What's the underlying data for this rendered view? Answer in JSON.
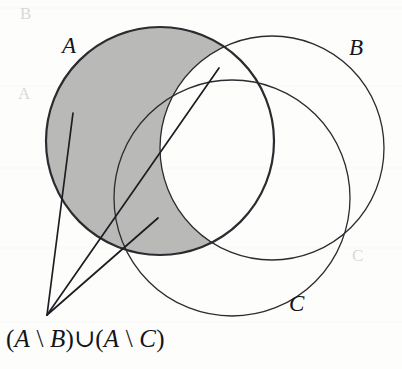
{
  "figure": {
    "kind": "venn-diagram",
    "background_color": "#fdfdfc",
    "stroke_color": "#2b2b30",
    "shade_color": "#b9b9b7",
    "width": 402,
    "height": 369
  },
  "labels": {
    "a": "A",
    "b": "B",
    "c": "C"
  },
  "caption": {
    "full_text": "(A \\ B)∪(A \\ C)",
    "parts": {
      "open1": "(",
      "a1": "A",
      "backslash1": " \\ ",
      "b": "B",
      "close1": ")",
      "union": "∪",
      "open2": "(",
      "a2": "A",
      "backslash2": " \\ ",
      "c": "C",
      "close2": ")"
    }
  },
  "circles": [
    {
      "name": "A",
      "cx": 160,
      "cy": 141,
      "r": 114,
      "filled": true,
      "stroke_width": 2.2
    },
    {
      "name": "B",
      "cx": 272,
      "cy": 148,
      "r": 112,
      "filled": false,
      "stroke_width": 1.3
    },
    {
      "name": "C",
      "cx": 232,
      "cy": 198,
      "r": 118,
      "filled": false,
      "stroke_width": 1.3
    }
  ],
  "leader_lines": [
    {
      "from_x": 47,
      "from_y": 315,
      "to_x": 73,
      "to_y": 113
    },
    {
      "from_x": 47,
      "from_y": 315,
      "to_x": 219,
      "to_y": 68
    },
    {
      "from_x": 47,
      "from_y": 315,
      "to_x": 158,
      "to_y": 218
    }
  ],
  "bleed_through": {
    "line1": "B",
    "line2": "A",
    "line3": "C"
  }
}
